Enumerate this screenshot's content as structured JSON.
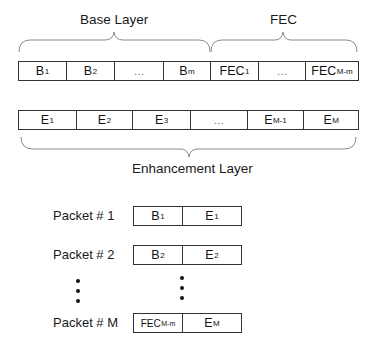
{
  "top_labels": {
    "base_layer": "Base Layer",
    "fec": "FEC"
  },
  "base_fec_row": [
    {
      "main": "B",
      "sub": "1"
    },
    {
      "main": "B",
      "sub": "2"
    },
    {
      "main": "…",
      "sub": ""
    },
    {
      "main": "B",
      "sub": "m"
    },
    {
      "main": "FEC",
      "sub": "1"
    },
    {
      "main": "…",
      "sub": ""
    },
    {
      "main": "FEC",
      "sub": "M-m"
    }
  ],
  "enhancement_row": [
    {
      "main": "E",
      "sub": "1"
    },
    {
      "main": "E",
      "sub": "2"
    },
    {
      "main": "E",
      "sub": "3"
    },
    {
      "main": "…",
      "sub": ""
    },
    {
      "main": "E",
      "sub": "M-1"
    },
    {
      "main": "E",
      "sub": "M"
    }
  ],
  "enhancement_label": "Enhancement Layer",
  "packets": [
    {
      "label": "Packet # 1",
      "left": {
        "main": "B",
        "sub": "1"
      },
      "right": {
        "main": "E",
        "sub": "1"
      }
    },
    {
      "label": "Packet # 2",
      "left": {
        "main": "B",
        "sub": "2"
      },
      "right": {
        "main": "E",
        "sub": "2"
      }
    },
    {
      "label": "Packet # M",
      "left": {
        "main": "FEC",
        "sub": "M-m"
      },
      "right": {
        "main": "E",
        "sub": "M"
      }
    }
  ],
  "colors": {
    "line": "#333333",
    "brace": "#8a8a8a",
    "text": "#1a1a1a"
  }
}
